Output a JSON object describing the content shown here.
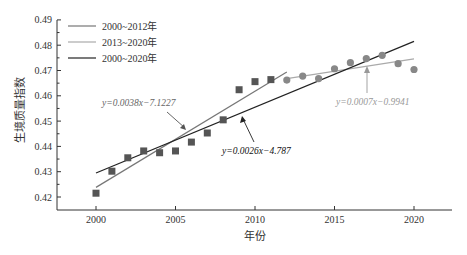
{
  "chart_data": {
    "type": "scatter",
    "title": "",
    "xlabel": "年份",
    "ylabel": "生境质量指数",
    "xlim": [
      1997.5,
      2022.3
    ],
    "ylim": [
      0.4148,
      0.49
    ],
    "x_ticks": [
      2000,
      2005,
      2010,
      2015,
      2020
    ],
    "y_ticks": [
      0.42,
      0.43,
      0.44,
      0.45,
      0.46,
      0.47,
      0.48,
      0.49
    ],
    "x_tick_labels": [
      "2000",
      "2005",
      "2010",
      "2015",
      "2020"
    ],
    "y_tick_labels": [
      "0.42",
      "0.43",
      "0.44",
      "0.45",
      "0.46",
      "0.47",
      "0.48",
      "0.49"
    ],
    "grid": false,
    "legend_position": "upper-left",
    "series": [
      {
        "name": "2000–2011 (squares)",
        "marker": "square",
        "color": "#555555",
        "x": [
          2000,
          2001,
          2002,
          2003,
          2004,
          2005,
          2006,
          2007,
          2008,
          2009,
          2010,
          2011
        ],
        "y": [
          0.4215,
          0.4302,
          0.4355,
          0.4382,
          0.4375,
          0.4382,
          0.4417,
          0.4453,
          0.4505,
          0.4624,
          0.4656,
          0.4664
        ]
      },
      {
        "name": "2012–2020 (circles)",
        "marker": "circle",
        "color": "#888888",
        "x": [
          2012,
          2013,
          2014,
          2015,
          2016,
          2017,
          2018,
          2019,
          2020
        ],
        "y": [
          0.4662,
          0.4678,
          0.4668,
          0.4707,
          0.4731,
          0.4747,
          0.476,
          0.4727,
          0.4704
        ]
      }
    ],
    "trend_lines": [
      {
        "name": "2000~2012年",
        "color": "#777777",
        "x": [
          2000,
          2012
        ],
        "y": [
          0.4238,
          0.4694
        ],
        "equation": "y=0.0038x−7.1227"
      },
      {
        "name": "2013~2020年",
        "color": "#aaaaaa",
        "x": [
          2012,
          2020
        ],
        "y": [
          0.4668,
          0.4746
        ],
        "equation": "y=0.0007x−0.9941"
      },
      {
        "name": "2000~2020年",
        "color": "#222222",
        "x": [
          2000,
          2020
        ],
        "y": [
          0.4295,
          0.4815
        ],
        "equation": "y=0.0026x−4.787"
      }
    ],
    "annotations": [
      {
        "text": "y=0.0038x−7.1227",
        "color": "#666666"
      },
      {
        "text": "y=0.0026x−4.787",
        "color": "#111111"
      },
      {
        "text": "y=0.0007x−0.9941",
        "color": "#999999"
      }
    ]
  },
  "legend": {
    "items": [
      {
        "label": "2000~2012年",
        "color": "#777777"
      },
      {
        "label": "2013~2020年",
        "color": "#aaaaaa"
      },
      {
        "label": "2000~2020年",
        "color": "#222222"
      }
    ]
  },
  "labels": {
    "xlabel": "年份",
    "ylabel": "生境质量指数",
    "eq1": "y=0.0038x−7.1227",
    "eq2": "y=0.0026x−4.787",
    "eq3": "y=0.0007x−0.9941"
  }
}
